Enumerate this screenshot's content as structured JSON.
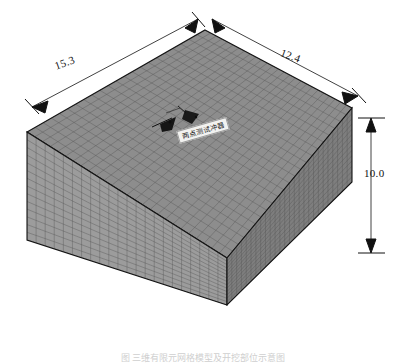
{
  "figure": {
    "caption": "图 三维有限元网格模型及开挖部位示意图"
  },
  "dimensions": {
    "width": {
      "value": "15.3",
      "edge": "top-left",
      "units": "m"
    },
    "depth": {
      "value": "12.4",
      "edge": "top-right",
      "units": "m"
    },
    "height": {
      "value": "10.0",
      "edge": "right-vertical",
      "units": "m"
    }
  },
  "annotations": {
    "excavation_label": "两点测试冲器",
    "excavation_marker_count": 2
  },
  "mesh": {
    "top_face_cols": 26,
    "top_face_rows": 22,
    "left_face_cols": 22,
    "left_face_rows": 14,
    "right_face_cols": 26,
    "right_face_rows": 14
  },
  "colors": {
    "top_face": "#8d8d8d",
    "left_face": "#9a9a9a",
    "right_face": "#7f7f7f",
    "mesh_line": "#555555",
    "outline": "#1a1a1a",
    "dim_line": "#111111",
    "excavation": "#161616",
    "background": "#ffffff"
  }
}
